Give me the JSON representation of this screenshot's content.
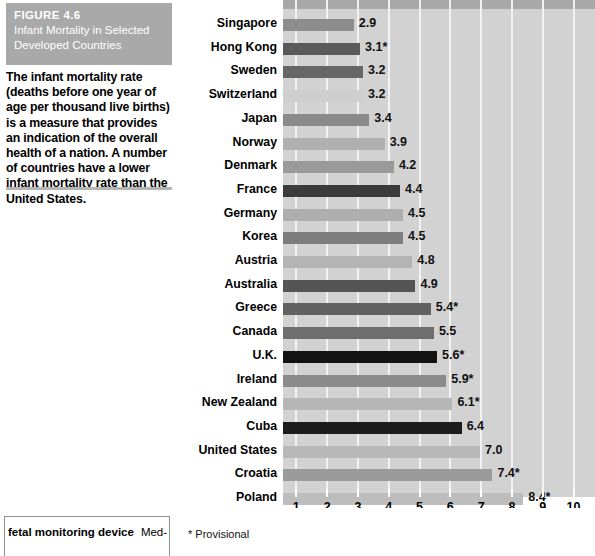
{
  "figure": {
    "number": "FIGURE 4.6",
    "title": "Infant Mortality in Selected Developed Countries",
    "caption": "The infant mortality rate (deaths before one year of age per thousand live births) is a measure that provides an indication of the overall health of a nation. A number of countries have a lower infant mortality rate than the United States."
  },
  "footer": {
    "glossary_term": "fetal monitoring device",
    "glossary_continuation": "Med-",
    "footnote": "* Provisional"
  },
  "chart_data": {
    "type": "bar",
    "orientation": "horizontal",
    "title": "Infant Mortality in Selected Developed Countries",
    "xlabel": "Infant mortality per 1,000 live births, 1999–2000",
    "ylabel": "",
    "xlim": [
      0,
      10.3
    ],
    "xticks": [
      1,
      2,
      3,
      4,
      5,
      6,
      7,
      8,
      9,
      10
    ],
    "xticklabels": [
      "1",
      "2",
      "3",
      "4",
      "5",
      "6",
      "7",
      "8",
      "9",
      "10"
    ],
    "grid": true,
    "legend": false,
    "note": "* Provisional",
    "categories": [
      "Singapore",
      "Hong Kong",
      "Sweden",
      "Switzerland",
      "Japan",
      "Norway",
      "Denmark",
      "France",
      "Germany",
      "Korea",
      "Austria",
      "Australia",
      "Greece",
      "Canada",
      "U.K.",
      "Ireland",
      "New Zealand",
      "Cuba",
      "United States",
      "Croatia",
      "Poland"
    ],
    "values": [
      2.9,
      3.1,
      3.2,
      3.2,
      3.4,
      3.9,
      4.2,
      4.4,
      4.5,
      4.5,
      4.8,
      4.9,
      5.4,
      5.5,
      5.6,
      5.9,
      6.1,
      6.4,
      7.0,
      7.4,
      8.4
    ],
    "value_labels": [
      "2.9",
      "3.1*",
      "3.2",
      "3.2",
      "3.4",
      "3.9",
      "4.2",
      "4.4",
      "4.5",
      "4.5",
      "4.8",
      "4.9",
      "5.4*",
      "5.5",
      "5.6*",
      "5.9*",
      "6.1*",
      "6.4",
      "7.0",
      "7.4*",
      "8.4*"
    ],
    "bar_colors": [
      "#8d8d8d",
      "#5a5a5a",
      "#666666",
      "#cfcfcf",
      "#8a8a8a",
      "#b0b0b0",
      "#9a9a9a",
      "#3b3b3b",
      "#aeaeae",
      "#7d7d7d",
      "#b4b4b4",
      "#555555",
      "#616161",
      "#6e6e6e",
      "#131313",
      "#8b8b8b",
      "#b6b6b6",
      "#1d1d1d",
      "#b8b8b8",
      "#9b9b9b",
      "#bdbdbd"
    ]
  },
  "style": {
    "plot_background": "#d2d2d2",
    "gridline_color": "#f2f2f2",
    "header_background": "#a9a9a9",
    "header_text": "#ffffff"
  }
}
